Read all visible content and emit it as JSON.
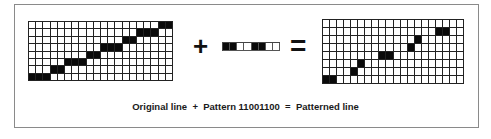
{
  "diagram": {
    "plus_symbol": "+",
    "equals_symbol": "=",
    "caption": {
      "original": "Original line",
      "plus": "+",
      "pattern_label": "Pattern 11001100",
      "equals": "=",
      "result": "Patterned line"
    },
    "original_grid": {
      "cols": 20,
      "rows": 8,
      "filled": [
        [
          7,
          0
        ],
        [
          7,
          1
        ],
        [
          7,
          2
        ],
        [
          6,
          3
        ],
        [
          6,
          4
        ],
        [
          5,
          5
        ],
        [
          5,
          6
        ],
        [
          5,
          7
        ],
        [
          4,
          8
        ],
        [
          4,
          9
        ],
        [
          3,
          10
        ],
        [
          3,
          11
        ],
        [
          3,
          12
        ],
        [
          2,
          13
        ],
        [
          2,
          14
        ],
        [
          1,
          15
        ],
        [
          1,
          16
        ],
        [
          1,
          17
        ],
        [
          0,
          18
        ],
        [
          0,
          19
        ]
      ]
    },
    "pattern": {
      "bits": "11001100",
      "cells": [
        1,
        1,
        0,
        0,
        1,
        1,
        0,
        0
      ]
    },
    "patterned_grid": {
      "cols": 20,
      "rows": 8,
      "filled": [
        [
          7,
          0
        ],
        [
          7,
          1
        ],
        [
          6,
          4
        ],
        [
          5,
          5
        ],
        [
          4,
          8
        ],
        [
          4,
          9
        ],
        [
          3,
          12
        ],
        [
          2,
          13
        ],
        [
          1,
          16
        ],
        [
          1,
          17
        ]
      ]
    }
  }
}
